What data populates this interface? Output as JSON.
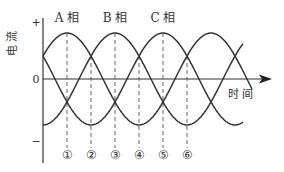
{
  "diagram": {
    "y_axis_label": "电 流",
    "x_axis_label": "时 间",
    "plus_mark": "+",
    "minus_mark": "−",
    "zero_mark": "0",
    "phases": [
      {
        "label": "A 相",
        "peak_x": 67
      },
      {
        "label": "B 相",
        "peak_x": 115
      },
      {
        "label": "C 相",
        "peak_x": 163
      }
    ],
    "markers": [
      "①",
      "②",
      "③",
      "④",
      "⑤",
      "⑥"
    ],
    "line_color": "#333333"
  },
  "chart_data": {
    "type": "line",
    "title": "",
    "xlabel": "时间",
    "ylabel": "电流",
    "series": [
      {
        "name": "A 相",
        "phase_deg": 0
      },
      {
        "name": "B 相",
        "phase_deg": -120
      },
      {
        "name": "C 相",
        "phase_deg": -240
      }
    ],
    "markers": [
      "①",
      "②",
      "③",
      "④",
      "⑤",
      "⑥"
    ],
    "marker_spacing_deg": 60
  }
}
